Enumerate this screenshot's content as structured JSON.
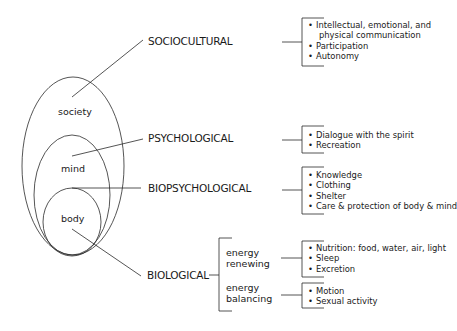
{
  "diagram": {
    "type": "nested-ellipses-with-brackets",
    "nested_regions": [
      {
        "id": "society",
        "label": "society"
      },
      {
        "id": "mind",
        "label": "mind"
      },
      {
        "id": "body",
        "label": "body"
      }
    ],
    "categories": [
      {
        "id": "sociocultural",
        "label": "SOCIOCULTURAL",
        "connects_to": "society",
        "items": [
          "Intellectual, emotional, and",
          "physical communication",
          "Participation",
          "Autonomy"
        ]
      },
      {
        "id": "psychological",
        "label": "PSYCHOLOGICAL",
        "connects_to": "mind",
        "items": [
          "Dialogue with the spirit",
          "Recreation"
        ]
      },
      {
        "id": "biopsychological",
        "label": "BIOPSYCHOLOGICAL",
        "connects_to": "body-mind boundary",
        "items": [
          "Knowledge",
          "Clothing",
          "Shelter",
          "Care & protection of body & mind"
        ]
      },
      {
        "id": "biological",
        "label": "BIOLOGICAL",
        "connects_to": "body",
        "subgroups": [
          {
            "id": "energy-renewing",
            "label_line1": "energy",
            "label_line2": "renewing",
            "items": [
              "Nutrition: food, water, air, light",
              "Sleep",
              "Excretion"
            ]
          },
          {
            "id": "energy-balancing",
            "label_line1": "energy",
            "label_line2": "balancing",
            "items": [
              "Motion",
              "Sexual activity"
            ]
          }
        ]
      }
    ]
  },
  "colors": {
    "line": "#2a2a2a",
    "text": "#1a1a1a",
    "background": "#ffffff"
  }
}
